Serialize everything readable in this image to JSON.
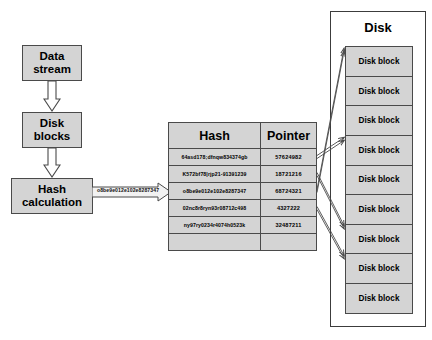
{
  "flow": {
    "data_stream": "Data stream",
    "disk_blocks": "Disk blocks",
    "hash_calculation": "Hash calculation",
    "hash_value_label": "o8be9e012e102e8287347"
  },
  "table": {
    "headers": {
      "hash": "Hash",
      "pointer": "Pointer"
    },
    "rows": [
      {
        "hash": "64asd178;dfnqw834374gb",
        "pointer": "57624982"
      },
      {
        "hash": "K572bf78|rjp21-91391239",
        "pointer": "18721216"
      },
      {
        "hash": "o8be9e012e102e8287347",
        "pointer": "68724321"
      },
      {
        "hash": "02nc8r8ryn93r08712c498",
        "pointer": "4327222"
      },
      {
        "hash": "ny97ry0234r4074h0523k",
        "pointer": "32487211"
      }
    ]
  },
  "disk": {
    "title": "Disk",
    "blocks": [
      {
        "label": "Disk block"
      },
      {
        "label": "Disk block"
      },
      {
        "label": "Disk block"
      },
      {
        "label": "Disk block"
      },
      {
        "label": "Disk block"
      },
      {
        "label": "Disk block"
      },
      {
        "label": "Disk block"
      },
      {
        "label": "Disk block"
      },
      {
        "label": "Disk block"
      }
    ]
  },
  "colors": {
    "box_fill": "#d4d4d4",
    "box_border": "#4a4a4a",
    "panel_border": "#3c3c3c",
    "background": "#ffffff",
    "text": "#000000"
  }
}
